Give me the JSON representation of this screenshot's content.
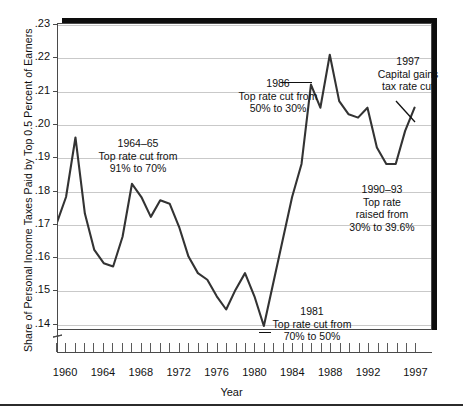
{
  "chart_data": {
    "type": "line",
    "title": "",
    "xlabel": "Year",
    "ylabel": "Share of Personal Income Taxes Paid by Top 0.5 Percent of Earners",
    "xlim": [
      1958,
      1998
    ],
    "ylim": [
      0.135,
      0.23
    ],
    "grid": true,
    "legend": "none",
    "y_ticks": [
      ".14",
      ".15",
      ".16",
      ".17",
      ".18",
      ".19",
      ".20",
      ".21",
      ".22",
      ".23"
    ],
    "y_tick_values": [
      0.14,
      0.15,
      0.16,
      0.17,
      0.18,
      0.19,
      0.2,
      0.21,
      0.22,
      0.23
    ],
    "x_ticks": [
      "1960",
      "1964",
      "1968",
      "1972",
      "1976",
      "1980",
      "1984",
      "1988",
      "1992",
      "1997"
    ],
    "x_tick_values": [
      1960,
      1964,
      1968,
      1972,
      1976,
      1980,
      1984,
      1988,
      1992,
      1997
    ],
    "x_minor_tick_years": [
      1959,
      1960,
      1961,
      1962,
      1963,
      1964,
      1965,
      1966,
      1967,
      1968,
      1969,
      1970,
      1971,
      1972,
      1973,
      1974,
      1975,
      1976,
      1977,
      1978,
      1979,
      1980,
      1981,
      1982,
      1983,
      1984,
      1985,
      1986,
      1987,
      1988,
      1989,
      1990,
      1991,
      1992,
      1993,
      1994,
      1995,
      1996,
      1997
    ],
    "series": [
      {
        "name": "Share of personal income taxes paid by top 0.5% of earners",
        "x": [
          1959,
          1960,
          1961,
          1962,
          1963,
          1964,
          1965,
          1966,
          1967,
          1968,
          1969,
          1970,
          1971,
          1972,
          1973,
          1974,
          1975,
          1976,
          1977,
          1978,
          1979,
          1980,
          1981,
          1982,
          1983,
          1984,
          1985,
          1986,
          1987,
          1988,
          1989,
          1990,
          1991,
          1992,
          1993,
          1994,
          1995,
          1996,
          1997
        ],
        "values": [
          0.17,
          0.178,
          0.196,
          0.173,
          0.162,
          0.158,
          0.157,
          0.166,
          0.182,
          0.178,
          0.172,
          0.177,
          0.176,
          0.169,
          0.16,
          0.155,
          0.153,
          0.148,
          0.144,
          0.15,
          0.155,
          0.148,
          0.139,
          0.152,
          0.165,
          0.178,
          0.188,
          0.212,
          0.205,
          0.221,
          0.207,
          0.203,
          0.202,
          0.205,
          0.193,
          0.188,
          0.188,
          0.198,
          0.205
        ],
        "color": "#333333"
      }
    ],
    "annotations": [
      {
        "id": "1964",
        "text": "1964–65\nTop rate cut from\n91% to 70%"
      },
      {
        "id": "1986",
        "text": "1986\nTop rate cut from\n50% to 30%"
      },
      {
        "id": "1997",
        "text": "1997\nCapital gains\ntax rate cut"
      },
      {
        "id": "1990",
        "text": "1990–93\nTop rate\nraised from\n30% to 39.6%"
      },
      {
        "id": "1981",
        "text": "1981\nTop rate cut from\n70% to 50%"
      }
    ]
  },
  "axes": {
    "x_title": "Year",
    "y_title": "Share of Personal Income Taxes Paid by Top 0.5 Percent of Earners"
  },
  "annotations": {
    "a1964": "1964–65\nTop rate cut from\n91% to 70%",
    "a1986": "1986\nTop rate cut from\n50% to 30%",
    "a1997": "1997\nCapital gains\ntax rate cut",
    "a1990": "1990–93\nTop rate\nraised from\n30% to 39.6%",
    "a1981": "1981\nTop rate cut from\n70% to 50%"
  },
  "colors": {
    "line": "#333333",
    "grid": "#c9c9c9",
    "frame": "#4a4a4a",
    "shadow": "#0d0d0d",
    "text": "#111111"
  }
}
